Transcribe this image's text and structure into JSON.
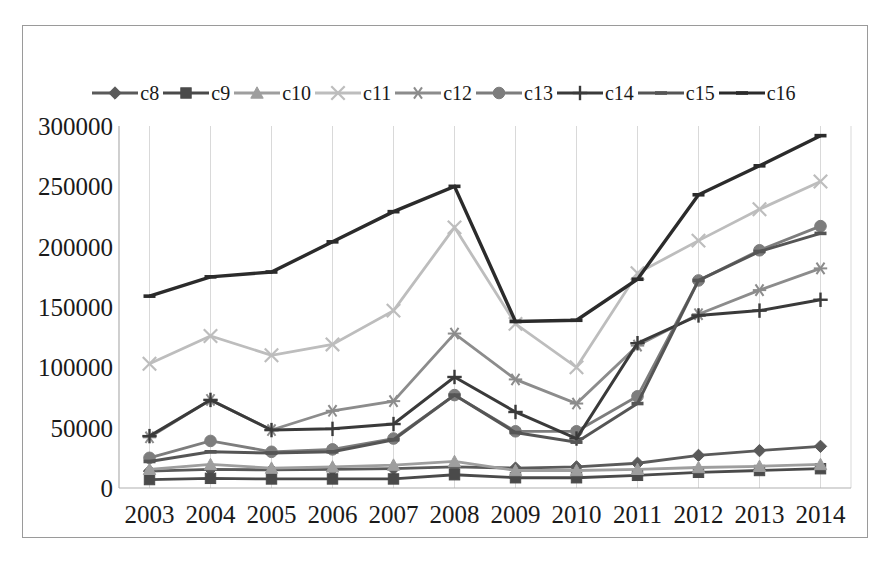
{
  "chart_data": {
    "type": "line",
    "title": "",
    "subtitle": "",
    "xlabel": "",
    "ylabel": "",
    "categories": [
      "2003",
      "2004",
      "2005",
      "2006",
      "2007",
      "2008",
      "2009",
      "2010",
      "2011",
      "2012",
      "2013",
      "2014"
    ],
    "x": [
      2003,
      2004,
      2005,
      2006,
      2007,
      2008,
      2009,
      2010,
      2011,
      2012,
      2013,
      2014
    ],
    "ylim": [
      0,
      300000
    ],
    "yticks": [
      0,
      50000,
      100000,
      150000,
      200000,
      250000,
      300000
    ],
    "ytick_labels": [
      "0",
      "50000",
      "100000",
      "150000",
      "200000",
      "250000",
      "300000"
    ],
    "grid": "vertical",
    "legend_position": "top",
    "series": [
      {
        "name": "c8",
        "marker": "diamond",
        "color": "#5a5a5a",
        "values": [
          14000,
          15500,
          15000,
          15500,
          16000,
          17500,
          16500,
          17500,
          20500,
          27000,
          31000,
          34500
        ]
      },
      {
        "name": "c9",
        "marker": "square",
        "color": "#4a4a4a",
        "values": [
          7000,
          8000,
          7500,
          7500,
          7500,
          11000,
          8500,
          8500,
          10500,
          13000,
          14500,
          16000
        ]
      },
      {
        "name": "c10",
        "marker": "triangle",
        "color": "#9e9e9e",
        "values": [
          15500,
          19500,
          16500,
          17500,
          19000,
          22000,
          14500,
          14500,
          15500,
          17000,
          18000,
          19500
        ]
      },
      {
        "name": "c11",
        "marker": "x",
        "color": "#bdbdbd",
        "values": [
          103000,
          126000,
          110000,
          119000,
          147000,
          216000,
          136000,
          100000,
          178000,
          205000,
          231000,
          254000
        ]
      },
      {
        "name": "c12",
        "marker": "asterisk",
        "color": "#8c8c8c",
        "values": [
          42000,
          73000,
          48000,
          64000,
          72000,
          128000,
          90000,
          70000,
          118000,
          144000,
          164000,
          182000
        ]
      },
      {
        "name": "c13",
        "marker": "circle",
        "color": "#7d7d7d",
        "values": [
          25000,
          39000,
          30000,
          32000,
          41000,
          77000,
          47000,
          47000,
          76000,
          172000,
          197000,
          217000
        ]
      },
      {
        "name": "c14",
        "marker": "plus",
        "color": "#3a3a3a",
        "values": [
          43000,
          73000,
          48000,
          49000,
          53000,
          92000,
          63000,
          41000,
          120000,
          143000,
          147000,
          156000
        ]
      },
      {
        "name": "c15",
        "marker": "line",
        "color": "#555555",
        "values": [
          22000,
          30000,
          29000,
          30000,
          40000,
          77000,
          46000,
          38000,
          70000,
          172000,
          196000,
          211000
        ]
      },
      {
        "name": "c16",
        "marker": "line",
        "color": "#2b2b2b",
        "values": [
          159000,
          175000,
          179000,
          204000,
          229000,
          250000,
          138000,
          139000,
          173000,
          243000,
          267000,
          292000
        ]
      }
    ]
  },
  "chart_meta": {
    "frame_border_color": "#9a9a9a",
    "gridline_color": "#d9d9d9",
    "axis_color": "#b0b0b0",
    "background": "#ffffff"
  }
}
